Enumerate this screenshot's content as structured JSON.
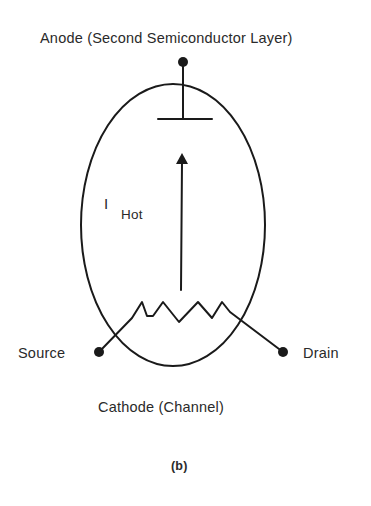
{
  "diagram": {
    "type": "device-schematic",
    "labels": {
      "anode": "Anode (Second Semiconductor Layer)",
      "current_symbol": "I",
      "current_subscript": "Hot",
      "source": "Source",
      "drain": "Drain",
      "cathode": "Cathode (Channel)",
      "figure_label": "(b)"
    },
    "colors": {
      "stroke": "#1a1a1a",
      "text": "#2a2a2a",
      "background": "#ffffff"
    }
  }
}
